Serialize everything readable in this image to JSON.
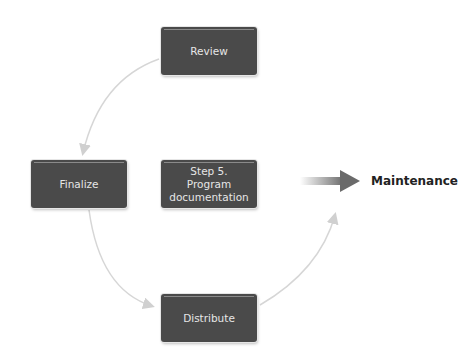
{
  "diagram": {
    "nodes": [
      {
        "id": "review",
        "label": "Review"
      },
      {
        "id": "finalize",
        "label": "Finalize"
      },
      {
        "id": "center",
        "label": "Step 5.\nProgram\ndocumentation"
      },
      {
        "id": "distribute",
        "label": "Distribute"
      }
    ],
    "output": {
      "label": "Maintenance"
    },
    "edges": [
      {
        "from": "review",
        "to": "finalize"
      },
      {
        "from": "finalize",
        "to": "distribute"
      },
      {
        "from": "distribute",
        "to": "review"
      }
    ],
    "colors": {
      "box": "#4a4a4a",
      "box_text": "#e6e6e6",
      "arrow": "#d0d0d0",
      "output_arrow": "#6a6a6a"
    }
  }
}
